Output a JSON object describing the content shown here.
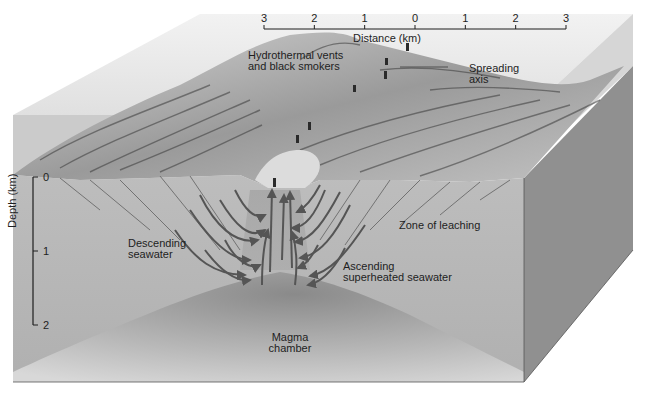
{
  "distance_axis": {
    "label": "Distance (km)",
    "ticks": [
      "3",
      "2",
      "1",
      "0",
      "1",
      "2",
      "3"
    ]
  },
  "depth_axis": {
    "label": "Depth (km)",
    "ticks": [
      "0",
      "1",
      "2"
    ]
  },
  "labels": {
    "vents_line1": "Hydrothermal vents",
    "vents_line2": "and black smokers",
    "axis_line1": "Spreading",
    "axis_line2": "axis",
    "descending_line1": "Descending",
    "descending_line2": "seawater",
    "leaching": "Zone of leaching",
    "ascending_line1": "Ascending",
    "ascending_line2": "superheated seawater",
    "magma_line1": "Magma",
    "magma_line2": "chamber"
  },
  "colors": {
    "water_top": "#ececec",
    "water_front": "#c9c9c9",
    "crust_front": "#b5b5b5",
    "crust_side": "#8f8f8f",
    "magma": "#9a9a9a",
    "arrows": "#555555",
    "text": "#1e1e1e"
  }
}
